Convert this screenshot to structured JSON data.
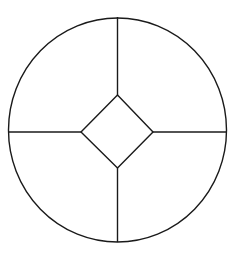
{
  "diagram": {
    "shapes": [
      {
        "kind": "circle",
        "name": "outer-circle"
      },
      {
        "kind": "diamond",
        "name": "center-diamond"
      },
      {
        "kind": "line",
        "name": "spoke-top",
        "from": "diamond-top-vertex",
        "to": "circle-top"
      },
      {
        "kind": "line",
        "name": "spoke-bottom",
        "from": "diamond-bottom-vertex",
        "to": "circle-bottom"
      },
      {
        "kind": "line",
        "name": "spoke-left",
        "from": "diamond-left-vertex",
        "to": "circle-left"
      },
      {
        "kind": "line",
        "name": "spoke-right",
        "from": "diamond-right-vertex",
        "to": "circle-right"
      }
    ],
    "stroke_color": "#1a1a1a",
    "background_color": "#ffffff"
  }
}
